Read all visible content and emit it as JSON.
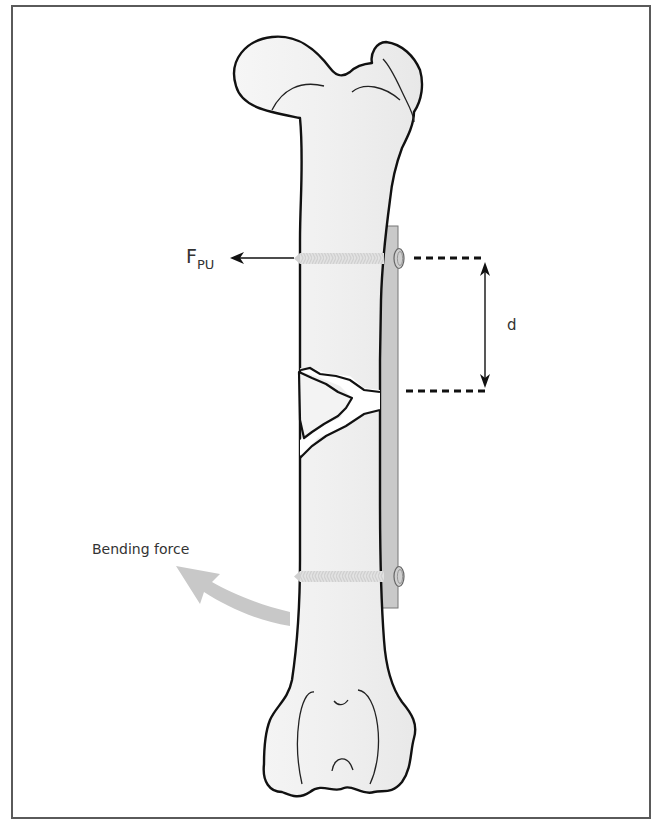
{
  "figure": {
    "labels": {
      "pullout_force_main": "F",
      "pullout_force_sub": "PU",
      "distance": "d",
      "bending_force": "Bending force"
    },
    "colors": {
      "bone_fill": "#f1f1f1",
      "outline": "#111111",
      "plate_fill": "#c9c9c9",
      "bending_arrow": "#c8c8c8",
      "screw": "#d9d9d9",
      "frame": "#5a5a5a"
    }
  }
}
